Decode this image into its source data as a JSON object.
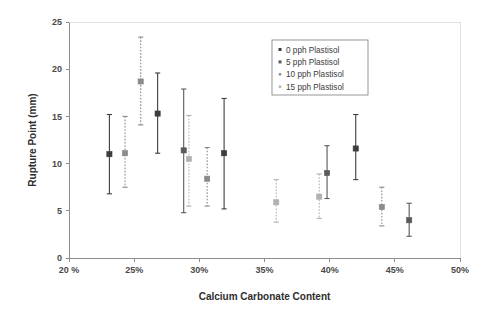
{
  "chart_data": {
    "type": "scatter",
    "title": "",
    "xlabel": "Calcium Carbonate Content",
    "ylabel": "Rupture Point (mm)",
    "xlim": [
      20,
      50
    ],
    "ylim": [
      0,
      25
    ],
    "xticks": [
      "20 %",
      "25%",
      "30%",
      "35%",
      "40%",
      "45%",
      "50%"
    ],
    "xtick_values": [
      20,
      25,
      30,
      35,
      40,
      45,
      50
    ],
    "yticks": [
      "0",
      "5",
      "10",
      "15",
      "20",
      "25"
    ],
    "ytick_values": [
      0,
      5,
      10,
      15,
      20,
      25
    ],
    "grid": false,
    "legend_position": "top-right",
    "error_bars": true,
    "series": [
      {
        "name": "0 pph Plastisol",
        "marker": "square",
        "color": "#3d3d3d",
        "line_style": "solid",
        "points": [
          {
            "x": 23.1,
            "y": 11.0,
            "lower": 6.8,
            "upper": 15.2
          },
          {
            "x": 26.8,
            "y": 15.3,
            "lower": 11.1,
            "upper": 19.6
          },
          {
            "x": 31.9,
            "y": 11.1,
            "lower": 5.2,
            "upper": 16.9
          },
          {
            "x": 42.0,
            "y": 11.6,
            "lower": 8.3,
            "upper": 15.2
          }
        ]
      },
      {
        "name": "5 pph Plastisol",
        "marker": "square",
        "color": "#5a5a5a",
        "line_style": "solid",
        "points": [
          {
            "x": 28.8,
            "y": 11.4,
            "lower": 4.8,
            "upper": 17.9
          },
          {
            "x": 39.8,
            "y": 9.0,
            "lower": 6.3,
            "upper": 11.9
          },
          {
            "x": 46.1,
            "y": 4.0,
            "lower": 2.3,
            "upper": 5.8
          }
        ]
      },
      {
        "name": "10 pph Plastisol",
        "marker": "square",
        "color": "#8a8a8a",
        "line_style": "dashed",
        "points": [
          {
            "x": 24.3,
            "y": 11.1,
            "lower": 7.5,
            "upper": 15.0
          },
          {
            "x": 25.5,
            "y": 18.7,
            "lower": 14.1,
            "upper": 23.4
          },
          {
            "x": 30.6,
            "y": 8.4,
            "lower": 5.5,
            "upper": 11.7
          },
          {
            "x": 44.0,
            "y": 5.4,
            "lower": 3.4,
            "upper": 7.5
          }
        ]
      },
      {
        "name": "15 pph Plastisol",
        "marker": "square",
        "color": "#b0b0b0",
        "line_style": "dashed",
        "points": [
          {
            "x": 29.2,
            "y": 10.5,
            "lower": 5.5,
            "upper": 15.1
          },
          {
            "x": 35.9,
            "y": 5.9,
            "lower": 3.8,
            "upper": 8.3
          },
          {
            "x": 39.2,
            "y": 6.5,
            "lower": 4.2,
            "upper": 8.9
          }
        ]
      }
    ]
  }
}
